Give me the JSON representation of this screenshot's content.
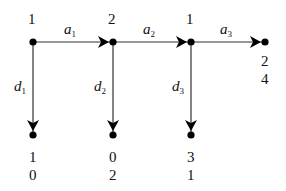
{
  "diagram": {
    "type": "game-tree",
    "colors": {
      "line": "#333333",
      "node": "#000000",
      "text": "#111111",
      "background": "#ffffff"
    },
    "nodes": [
      {
        "id": "n1",
        "player_label": "1",
        "x": 33,
        "y": 42
      },
      {
        "id": "n2",
        "player_label": "2",
        "x": 113,
        "y": 42
      },
      {
        "id": "n3",
        "player_label": "1",
        "x": 191,
        "y": 42
      },
      {
        "id": "t4",
        "payoff": [
          "2",
          "4"
        ],
        "x": 265,
        "y": 42
      },
      {
        "id": "t1",
        "payoff": [
          "1",
          "0"
        ],
        "x": 33,
        "y": 135
      },
      {
        "id": "t2",
        "payoff": [
          "0",
          "2"
        ],
        "x": 113,
        "y": 135
      },
      {
        "id": "t3",
        "payoff": [
          "3",
          "1"
        ],
        "x": 191,
        "y": 135
      }
    ],
    "edges": [
      {
        "from": "n1",
        "to": "n2",
        "label": "a",
        "sub": "1"
      },
      {
        "from": "n2",
        "to": "n3",
        "label": "a",
        "sub": "2"
      },
      {
        "from": "n3",
        "to": "t4",
        "label": "a",
        "sub": "3"
      },
      {
        "from": "n1",
        "to": "t1",
        "label": "d",
        "sub": "1"
      },
      {
        "from": "n2",
        "to": "t2",
        "label": "d",
        "sub": "2"
      },
      {
        "from": "n3",
        "to": "t3",
        "label": "d",
        "sub": "3"
      }
    ],
    "labels": {
      "player_n1": "1",
      "player_n2": "2",
      "player_n3": "1",
      "edge_a1": "a",
      "edge_a1_sub": "1",
      "edge_a2": "a",
      "edge_a2_sub": "2",
      "edge_a3": "a",
      "edge_a3_sub": "3",
      "edge_d1": "d",
      "edge_d1_sub": "1",
      "edge_d2": "d",
      "edge_d2_sub": "2",
      "edge_d3": "d",
      "edge_d3_sub": "3",
      "payoff_t4_p1": "2",
      "payoff_t4_p2": "4",
      "payoff_t1_p1": "1",
      "payoff_t1_p2": "0",
      "payoff_t2_p1": "0",
      "payoff_t2_p2": "2",
      "payoff_t3_p1": "3",
      "payoff_t3_p2": "1"
    }
  }
}
